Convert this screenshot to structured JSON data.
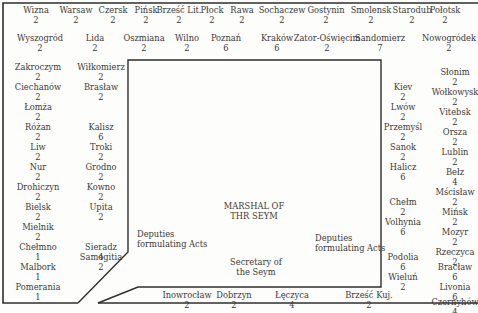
{
  "top_row": [
    {
      "name": "Wizna",
      "deputies": "2",
      "x": 36,
      "y": 5
    },
    {
      "name": "Warsaw",
      "deputies": "2",
      "x": 76,
      "y": 5
    },
    {
      "name": "Czersk",
      "deputies": "2",
      "x": 113,
      "y": 5
    },
    {
      "name": "Pińsk",
      "deputies": "2",
      "x": 146,
      "y": 5
    },
    {
      "name": "Brześć Lit.",
      "deputies": "2",
      "x": 179,
      "y": 5
    },
    {
      "name": "Płock",
      "deputies": "2",
      "x": 212,
      "y": 5
    },
    {
      "name": "Rawa",
      "deputies": "2",
      "x": 242,
      "y": 5
    },
    {
      "name": "Sochaczew",
      "deputies": "2",
      "x": 282,
      "y": 5
    },
    {
      "name": "Gostynin",
      "deputies": "2",
      "x": 326,
      "y": 5
    },
    {
      "name": "Smolensk",
      "deputies": "2",
      "x": 371,
      "y": 5
    },
    {
      "name": "Starodub",
      "deputies": "2",
      "x": 412,
      "y": 5
    },
    {
      "name": "Połotsk",
      "deputies": "2",
      "x": 445,
      "y": 5
    }
  ],
  "second_row": [
    {
      "name": "Wyszogród",
      "deputies": "2",
      "x": 40,
      "y": 33
    },
    {
      "name": "Lida",
      "deputies": "2",
      "x": 95,
      "y": 33
    },
    {
      "name": "Oszmiana",
      "deputies": "2",
      "x": 144,
      "y": 33
    },
    {
      "name": "Wilno",
      "deputies": "2",
      "x": 187,
      "y": 33
    },
    {
      "name": "Poznań",
      "deputies": "6",
      "x": 226,
      "y": 33
    },
    {
      "name": "Kraków",
      "deputies": "6",
      "x": 277,
      "y": 33
    },
    {
      "name": "Zator-Oświęcim",
      "deputies": "2",
      "x": 327,
      "y": 33
    },
    {
      "name": "Sandomierz",
      "deputies": "7",
      "x": 380,
      "y": 33
    },
    {
      "name": "Nowogródek",
      "deputies": "2",
      "x": 449,
      "y": 33
    }
  ],
  "left_column_outer": [
    {
      "name": "Zakroczym",
      "deputies": "2",
      "x": 38,
      "y": 62
    },
    {
      "name": "Ciechanów",
      "deputies": "2",
      "x": 38,
      "y": 82
    },
    {
      "name": "Łomża",
      "deputies": "2",
      "x": 38,
      "y": 102
    },
    {
      "name": "Różan",
      "deputies": "2",
      "x": 38,
      "y": 122
    },
    {
      "name": "Liw",
      "deputies": "2",
      "x": 38,
      "y": 142
    },
    {
      "name": "Nur",
      "deputies": "2",
      "x": 38,
      "y": 162
    },
    {
      "name": "Drohiczyn",
      "deputies": "2",
      "x": 38,
      "y": 182
    },
    {
      "name": "Bielsk",
      "deputies": "2",
      "x": 38,
      "y": 202
    },
    {
      "name": "Mielnik",
      "deputies": "2",
      "x": 38,
      "y": 222
    },
    {
      "name": "Chełmno",
      "deputies": "1",
      "x": 38,
      "y": 242
    },
    {
      "name": "Malbork",
      "deputies": "1",
      "x": 38,
      "y": 262
    },
    {
      "name": "Pomerania",
      "deputies": "1",
      "x": 38,
      "y": 282
    }
  ],
  "left_column_inner": [
    {
      "name": "Wiłkomierz",
      "deputies": "2",
      "x": 101,
      "y": 62
    },
    {
      "name": "Brasław",
      "deputies": "2",
      "x": 101,
      "y": 82
    },
    {
      "name": "Kalisz",
      "deputies": "6",
      "x": 101,
      "y": 122
    },
    {
      "name": "Troki",
      "deputies": "2",
      "x": 101,
      "y": 142
    },
    {
      "name": "Grodno",
      "deputies": "2",
      "x": 101,
      "y": 162
    },
    {
      "name": "Kowno",
      "deputies": "2",
      "x": 101,
      "y": 182
    },
    {
      "name": "Upita",
      "deputies": "2",
      "x": 101,
      "y": 202
    },
    {
      "name": "Sieradz",
      "deputies": "4",
      "x": 101,
      "y": 242
    },
    {
      "name": "Samogitia",
      "deputies": "2",
      "x": 101,
      "y": 252
    }
  ],
  "right_column_inner": [
    {
      "name": "Kiev",
      "deputies": "2",
      "x": 403,
      "y": 82
    },
    {
      "name": "Lwów",
      "deputies": "2",
      "x": 403,
      "y": 102
    },
    {
      "name": "Przemyśl",
      "deputies": "2",
      "x": 403,
      "y": 122
    },
    {
      "name": "Sanok",
      "deputies": "2",
      "x": 403,
      "y": 142
    },
    {
      "name": "Halicz",
      "deputies": "6",
      "x": 403,
      "y": 162
    },
    {
      "name": "Chełm",
      "deputies": "2",
      "x": 403,
      "y": 197
    },
    {
      "name": "Volhynia",
      "deputies": "6",
      "x": 403,
      "y": 217
    },
    {
      "name": "Podolia",
      "deputies": "6",
      "x": 403,
      "y": 252
    },
    {
      "name": "Wieluń",
      "deputies": "2",
      "x": 403,
      "y": 272
    }
  ],
  "right_column_outer": [
    {
      "name": "Słonim",
      "deputies": "2",
      "x": 455,
      "y": 67
    },
    {
      "name": "Wołkowysk",
      "deputies": "2",
      "x": 455,
      "y": 87
    },
    {
      "name": "Vitebsk",
      "deputies": "2",
      "x": 455,
      "y": 107
    },
    {
      "name": "Orsza",
      "deputies": "2",
      "x": 455,
      "y": 127
    },
    {
      "name": "Lublin",
      "deputies": "2",
      "x": 455,
      "y": 147
    },
    {
      "name": "Bełz",
      "deputies": "4",
      "x": 455,
      "y": 167
    },
    {
      "name": "Mścisław",
      "deputies": "2",
      "x": 455,
      "y": 187
    },
    {
      "name": "Mińsk",
      "deputies": "2",
      "x": 455,
      "y": 207
    },
    {
      "name": "Mozyr",
      "deputies": "2",
      "x": 455,
      "y": 227
    },
    {
      "name": "Rzeczyca",
      "deputies": "2",
      "x": 455,
      "y": 247
    },
    {
      "name": "Bracław",
      "deputies": "6",
      "x": 455,
      "y": 262
    },
    {
      "name": "Livonia",
      "deputies": "6",
      "x": 455,
      "y": 282
    },
    {
      "name": "Czernyhów",
      "deputies": "4",
      "x": 455,
      "y": 297
    }
  ],
  "bottom_row": [
    {
      "name": "Inowrocław",
      "deputies": "2",
      "x": 187,
      "y": 290
    },
    {
      "name": "Dobrzyn",
      "deputies": "2",
      "x": 234,
      "y": 290
    },
    {
      "name": "Łęczyca",
      "deputies": "4",
      "x": 292,
      "y": 290
    },
    {
      "name": "Brześć Kuj.",
      "deputies": "2",
      "x": 369,
      "y": 290
    }
  ],
  "center": {
    "marshal_line1": "MARSHAL OF",
    "marshal_line2": "THR SEYM",
    "deputies_left_line1": "Deputies",
    "deputies_left_line2": "formulating Acts",
    "deputies_right_line1": "Deputies",
    "deputies_right_line2": "formulating Acts",
    "secretary_line1": "Secretary of",
    "secretary_line2": "the Seym"
  },
  "colors": {
    "ink": "#3a3a3a",
    "line": "#2e2e2e",
    "paper": "#fdfdfb"
  }
}
